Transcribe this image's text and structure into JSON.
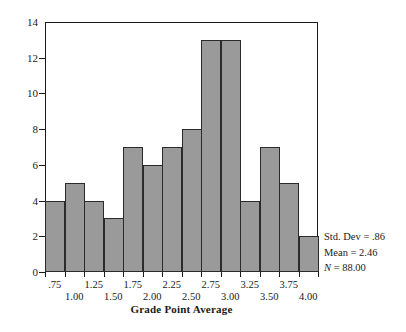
{
  "chart_data": {
    "type": "bar",
    "title": "",
    "subtitle": "",
    "xlabel": "Grade Point Average",
    "ylabel": "",
    "categories": [
      ".75",
      "1.00",
      "1.25",
      "1.50",
      "1.75",
      "2.00",
      "2.25",
      "2.50",
      "2.75",
      "3.00",
      "3.25",
      "3.50",
      "3.75",
      "4.00"
    ],
    "values": [
      4,
      5,
      4,
      3,
      7,
      6,
      7,
      8,
      13,
      13,
      4,
      7,
      5,
      2
    ],
    "bin_width": 0.25,
    "xlim": [
      0.625,
      4.125
    ],
    "ylim": [
      0,
      14
    ],
    "yticks": [
      0,
      2,
      4,
      6,
      8,
      10,
      12,
      14
    ],
    "ytick_labels": [
      "0",
      "2",
      "4",
      "6",
      "8",
      "10",
      "12",
      "14"
    ],
    "xticks": [
      0.75,
      1.0,
      1.25,
      1.5,
      1.75,
      2.0,
      2.25,
      2.5,
      2.75,
      3.0,
      3.25,
      3.5,
      3.75,
      4.0
    ],
    "xtick_labels": [
      ".75",
      "1.00",
      "1.25",
      "1.50",
      "1.75",
      "2.00",
      "2.25",
      "2.50",
      "2.75",
      "3.00",
      "3.25",
      "3.50",
      "3.75",
      "4.00"
    ],
    "xtick_label_rows": [
      0,
      1,
      0,
      1,
      0,
      1,
      0,
      1,
      0,
      1,
      0,
      1,
      0,
      1
    ],
    "grid": false,
    "legend": "none",
    "bar_color": "#9a9a9a",
    "bar_edge_color": "#2b2b2b",
    "axis_color": "#1a1a1a",
    "background": "#ffffff"
  },
  "annotations": {
    "std_dev": "Std. Dev = .86",
    "mean": "Mean = 2.46",
    "n_symbol": "N",
    "n_value": " = 88.00"
  }
}
